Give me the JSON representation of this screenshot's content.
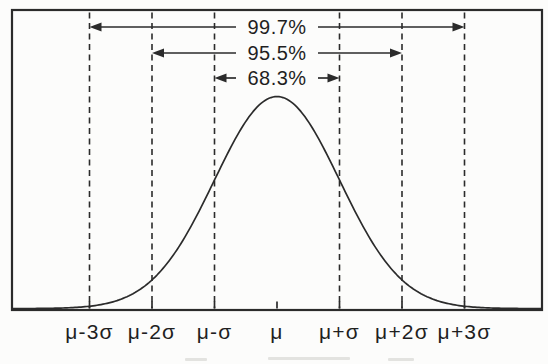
{
  "colors": {
    "background": "#fcfcfb",
    "ink": "#2b2b2b",
    "text": "#1f1f1f"
  },
  "chart_data": {
    "type": "line",
    "title": "",
    "curve": {
      "distribution": "normal",
      "center_label": "μ",
      "sd_label": "σ",
      "x_range_sigma": [
        -4.24,
        4.24
      ],
      "peak_at_sigma": 0
    },
    "x_ticks": [
      {
        "sigma": -3,
        "label": "μ-3σ",
        "dashed_line": true
      },
      {
        "sigma": -2,
        "label": "μ-2σ",
        "dashed_line": true
      },
      {
        "sigma": -1,
        "label": "μ-σ",
        "dashed_line": true
      },
      {
        "sigma": 0,
        "label": "μ",
        "dashed_line": false
      },
      {
        "sigma": 1,
        "label": "μ+σ",
        "dashed_line": true
      },
      {
        "sigma": 2,
        "label": "μ+2σ",
        "dashed_line": true
      },
      {
        "sigma": 3,
        "label": "μ+3σ",
        "dashed_line": true
      }
    ],
    "annotations": [
      {
        "label": "99.7%",
        "from_sigma": -3,
        "to_sigma": 3
      },
      {
        "label": "95.5%",
        "from_sigma": -2,
        "to_sigma": 2
      },
      {
        "label": "68.3%",
        "from_sigma": -1,
        "to_sigma": 1
      }
    ],
    "grid": false,
    "legend": false,
    "frame": true,
    "ylabel": "",
    "xlabel": ""
  }
}
